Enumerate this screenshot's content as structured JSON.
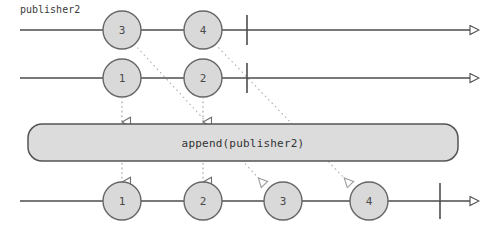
{
  "diagram": {
    "title_label": "publisher2",
    "operator_label": "append(publisher2)",
    "colors": {
      "marble_fill": "#d9d9d9",
      "marble_stroke": "#666666",
      "timeline_stroke": "#4d4d4d",
      "box_fill": "#dcdcdc",
      "box_stroke": "#545454",
      "dotted_stroke": "#b0b0b0",
      "text": "#4a4a4a",
      "background": "#ffffff"
    },
    "timelines": [
      {
        "name": "publisher2-timeline",
        "y": 30,
        "x_start": 20,
        "x_end": 474,
        "completion_x": 247,
        "has_label": true,
        "marbles": [
          {
            "value": "3",
            "cx": 122,
            "r": 19
          },
          {
            "value": "4",
            "cx": 203,
            "r": 19
          }
        ]
      },
      {
        "name": "publisher1-timeline",
        "y": 78,
        "x_start": 20,
        "x_end": 474,
        "completion_x": 247,
        "has_label": false,
        "marbles": [
          {
            "value": "1",
            "cx": 122,
            "r": 19
          },
          {
            "value": "2",
            "cx": 203,
            "r": 19
          }
        ]
      },
      {
        "name": "output-timeline",
        "y": 201,
        "x_start": 20,
        "x_end": 474,
        "completion_x": 440,
        "has_label": false,
        "marbles": [
          {
            "value": "1",
            "cx": 122,
            "r": 19
          },
          {
            "value": "2",
            "cx": 203,
            "r": 19
          },
          {
            "value": "3",
            "cx": 283,
            "r": 19
          },
          {
            "value": "4",
            "cx": 369,
            "r": 19
          }
        ]
      }
    ],
    "operator_box": {
      "x": 28,
      "y": 124,
      "width": 430,
      "height": 37,
      "radius": 14
    },
    "straight_connectors": [
      {
        "name": "connector-1",
        "x": 122,
        "from_y": 97,
        "to_y": 122
      },
      {
        "name": "connector-2",
        "x": 203,
        "from_y": 97,
        "to_y": 122
      },
      {
        "name": "connector-out-1",
        "x": 122,
        "from_y": 163,
        "to_y": 182
      },
      {
        "name": "connector-out-2",
        "x": 203,
        "from_y": 163,
        "to_y": 182
      }
    ],
    "diagonal_connectors": [
      {
        "name": "connector-3",
        "x1": 134,
        "y1": 44,
        "x2": 264,
        "y2": 184
      },
      {
        "name": "connector-4",
        "x1": 215,
        "y1": 44,
        "x2": 350,
        "y2": 184
      }
    ]
  }
}
